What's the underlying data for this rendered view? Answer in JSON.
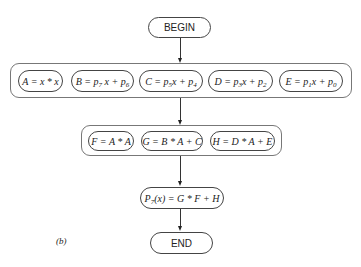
{
  "diagram": {
    "begin": "BEGIN",
    "end": "END",
    "caption": "(b)",
    "stage1": [
      {
        "id": "A",
        "text": "A = x * x"
      },
      {
        "id": "B",
        "lhs": "B = p",
        "s1": "7",
        "mid": " x + p",
        "s2": "6"
      },
      {
        "id": "C",
        "lhs": "C = p",
        "s1": "5",
        "mid": "x + p",
        "s2": "4"
      },
      {
        "id": "D",
        "lhs": "D = p",
        "s1": "3",
        "mid": "x + p",
        "s2": "2"
      },
      {
        "id": "E",
        "lhs": "E = p",
        "s1": "1",
        "mid": "x + p",
        "s2": "0"
      }
    ],
    "stage2": [
      {
        "id": "F",
        "text": "F = A * A"
      },
      {
        "id": "G",
        "text": "G = B * A + C"
      },
      {
        "id": "H",
        "text": "H = D * A + E"
      }
    ],
    "final": {
      "lhs": "P",
      "sub": "7",
      "rhs": "(x) = G * F + H"
    }
  }
}
